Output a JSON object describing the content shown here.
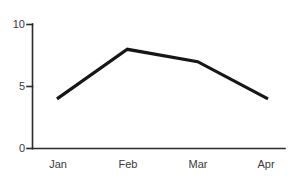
{
  "chart_data": {
    "type": "line",
    "title": "",
    "subtitle": "",
    "xlabel": "",
    "ylabel": "",
    "categories": [
      "Jan",
      "Feb",
      "Mar",
      "Apr"
    ],
    "values": [
      4,
      8,
      7,
      4
    ],
    "series": [
      {
        "name": "",
        "values": [
          4,
          8,
          7,
          4
        ]
      }
    ],
    "ylim": [
      0,
      10
    ],
    "y_ticks": [
      "0",
      "5",
      "10"
    ],
    "y_tick_values": [
      0,
      5,
      10
    ],
    "x_ticks": [
      "Jan",
      "Feb",
      "Mar",
      "Apr"
    ],
    "grid": false,
    "legend": false,
    "legend_position": "none",
    "markers": false,
    "annotations": [],
    "colors": {
      "line": "#161616",
      "axis": "#2b2b2b",
      "text": "#3a3a3a",
      "background": "#ffffff"
    }
  },
  "axes": {
    "y_tick_labels": [
      {
        "text": "10",
        "value": 10
      },
      {
        "text": "5",
        "value": 5
      },
      {
        "text": "0",
        "value": 0
      }
    ],
    "x_tick_labels": [
      {
        "text": "Jan",
        "value": 4
      },
      {
        "text": "Feb",
        "value": 8
      },
      {
        "text": "Mar",
        "value": 7
      },
      {
        "text": "Apr",
        "value": 4
      }
    ]
  }
}
